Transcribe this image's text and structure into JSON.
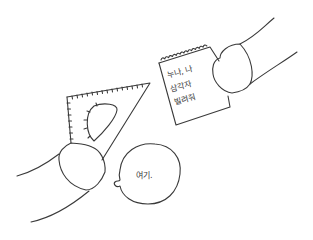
{
  "illustration": {
    "top_caption_cut": "",
    "note": {
      "lines": [
        "누나, 나",
        "삼각자",
        "빌려줘"
      ]
    },
    "speech_bubble": {
      "text": "여기."
    },
    "objects": [
      "left-hand",
      "right-hand",
      "triangle-ruler",
      "note-paper",
      "speech-bubble"
    ]
  }
}
